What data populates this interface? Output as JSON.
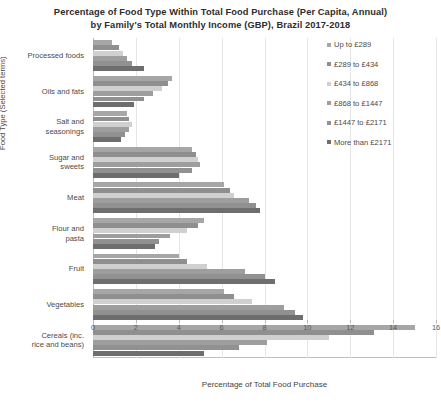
{
  "chart_data": {
    "type": "bar",
    "orientation": "horizontal",
    "title": "Percentage of Food Type Within Total Food Purchase (Per Capita, Annual) by Family's Total Monthly Income (GBP), Brazil 2017-2018",
    "title_line1": "Percentage of Food Type Within Total Food Purchase (Per Capita, Annual)",
    "title_line2": "by Family's Total Monthly Income (GBP), Brazil 2017-2018",
    "xlabel": "Percentage of Total Food Purchase",
    "ylabel": "Food Type (Selected terms)",
    "xlim": [
      0,
      16
    ],
    "xticks": [
      0,
      2,
      4,
      6,
      8,
      10,
      12,
      14,
      16
    ],
    "grid": true,
    "legend_position": "right",
    "categories": [
      "Processed foods",
      "Oils and fats",
      "Salt and seasonings",
      "Sugar and sweets",
      "Meat",
      "Flour and pasta",
      "Fruit",
      "Vegetables",
      "Cereals (inc. rice and beans)"
    ],
    "category_lines": [
      [
        "Processed foods"
      ],
      [
        "Oils and fats"
      ],
      [
        "Salt and",
        "seasonings"
      ],
      [
        "Sugar and",
        "sweets"
      ],
      [
        "Meat"
      ],
      [
        "Flour and",
        "pasta"
      ],
      [
        "Fruit"
      ],
      [
        "Vegetables"
      ],
      [
        "Cereals (inc.",
        "rice and beans)"
      ]
    ],
    "series": [
      {
        "name": "Up to £289",
        "color": "#a6a6a6",
        "values": [
          0.9,
          3.7,
          1.6,
          4.6,
          6.1,
          5.2,
          4.0,
          6.1,
          15.0
        ]
      },
      {
        "name": "£289 to £434",
        "color": "#8f8f8f",
        "values": [
          1.2,
          3.5,
          1.7,
          4.8,
          6.4,
          4.9,
          4.4,
          6.6,
          13.1
        ]
      },
      {
        "name": "£434 to £868",
        "color": "#d0d0d0",
        "values": [
          1.4,
          3.2,
          1.8,
          4.9,
          6.6,
          4.4,
          5.3,
          7.4,
          11.0
        ]
      },
      {
        "name": "£868 to £1447",
        "color": "#9e9e9e",
        "values": [
          1.6,
          2.8,
          1.7,
          5.0,
          7.3,
          3.6,
          7.1,
          8.9,
          8.1
        ]
      },
      {
        "name": "£1447 to £2171",
        "color": "#919191",
        "values": [
          1.8,
          2.4,
          1.5,
          4.6,
          7.6,
          3.1,
          8.0,
          9.4,
          6.8
        ]
      },
      {
        "name": "More than £2171",
        "color": "#6e6e6e",
        "values": [
          2.4,
          1.9,
          1.3,
          4.0,
          7.8,
          2.9,
          8.5,
          9.8,
          5.2
        ]
      }
    ]
  }
}
